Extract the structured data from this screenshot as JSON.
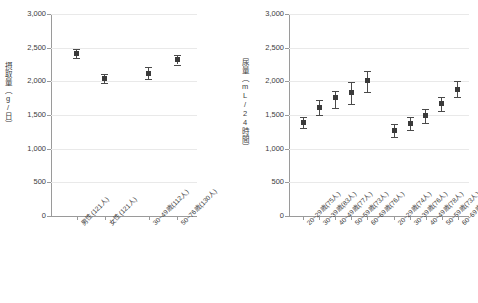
{
  "chart_data": [
    {
      "type": "scatter",
      "id": "intake-chart",
      "title": "",
      "xlabel": "",
      "ylabel": "摂取量（g/日）",
      "ylim": [
        0,
        3000
      ],
      "ytick_labels": [
        "3,000",
        "2,500",
        "2,000",
        "1,500",
        "1,000",
        "500",
        "0"
      ],
      "ytick_values": [
        3000,
        2500,
        2000,
        1500,
        1000,
        500,
        0
      ],
      "grid": true,
      "legend": "none",
      "categories": [
        "男性(121人)",
        "女性(121人)",
        "30~49歳(112人)",
        "50~76歳(130人)"
      ],
      "values": [
        2410,
        2040,
        2120,
        2320
      ],
      "err_low": [
        2340,
        1975,
        2030,
        2250
      ],
      "err_high": [
        2480,
        2105,
        2215,
        2390
      ],
      "group_breaks": [
        2
      ]
    },
    {
      "type": "scatter",
      "id": "urine-chart",
      "title": "",
      "xlabel": "",
      "ylabel": "尿量（mL/24時間）",
      "ylim": [
        0,
        3000
      ],
      "ytick_labels": [
        "3,000",
        "2,500",
        "2,000",
        "1,500",
        "1,000",
        "500",
        "0"
      ],
      "ytick_values": [
        3000,
        2500,
        2000,
        1500,
        1000,
        500,
        0
      ],
      "grid": true,
      "legend": "none",
      "categories": [
        "20~29歳(75人)",
        "30~39歳(83人)",
        "40~49歳(77人)",
        "50~59歳(73人)",
        "60~69歳(76人)",
        "20~29歳(74人)",
        "30~39歳(76人)",
        "40~49歳(78人)",
        "50~59歳(73人)",
        "60~69歳(75人)"
      ],
      "values": [
        1390,
        1615,
        1755,
        1830,
        2005,
        1275,
        1370,
        1490,
        1665,
        1885
      ],
      "err_low": [
        1300,
        1500,
        1610,
        1670,
        1835,
        1175,
        1280,
        1375,
        1565,
        1770
      ],
      "err_high": [
        1470,
        1720,
        1855,
        1995,
        2155,
        1370,
        1465,
        1595,
        1765,
        2000
      ],
      "group_breaks": [
        5
      ]
    }
  ]
}
